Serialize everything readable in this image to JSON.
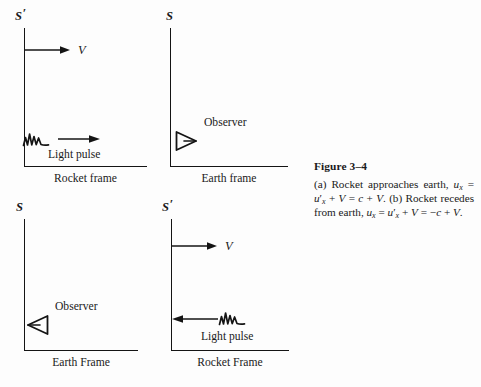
{
  "figure": {
    "caption_title": "Figure 3–4",
    "caption_part_a": "(a) Rocket approaches earth,",
    "caption_part_b": "(b) Rocket recedes from earth,",
    "equation_a": "uₓ = u′ₓ + V = c + V.",
    "equation_b": "uₓ = u′ₓ + V = −c + V.",
    "caption_full": "(a) Rocket approaches earth, uₓ = u′ₓ + V = c + V. (b) Rocket recedes from earth, uₓ = u′ₓ + V = −c + V."
  },
  "panels": [
    {
      "id": "top-left",
      "frame_symbol": "S",
      "frame_prime": "′",
      "caption": "Rocket frame",
      "velocity_label": "V",
      "velocity_arrow_direction": "right",
      "content_label": "Light pulse",
      "content_glyph": "light-pulse-wave",
      "pulse_arrow_direction": "right"
    },
    {
      "id": "top-right",
      "frame_symbol": "S",
      "frame_prime": "",
      "caption": "Earth frame",
      "velocity_label": "",
      "velocity_arrow_direction": "",
      "content_label": "Observer",
      "content_glyph": "observer-eye",
      "observer_direction": "right"
    },
    {
      "id": "bottom-left",
      "frame_symbol": "S",
      "frame_prime": "",
      "caption": "Earth Frame",
      "velocity_label": "",
      "velocity_arrow_direction": "",
      "content_label": "Observer",
      "content_glyph": "observer-eye",
      "observer_direction": "left"
    },
    {
      "id": "bottom-right",
      "frame_symbol": "S",
      "frame_prime": "′",
      "caption": "Rocket Frame",
      "velocity_label": "V",
      "velocity_arrow_direction": "right",
      "content_label": "Light pulse",
      "content_glyph": "light-pulse-wave",
      "pulse_arrow_direction": "left"
    }
  ],
  "colors": {
    "background": "#fdfdfd",
    "ink": "#141414"
  }
}
